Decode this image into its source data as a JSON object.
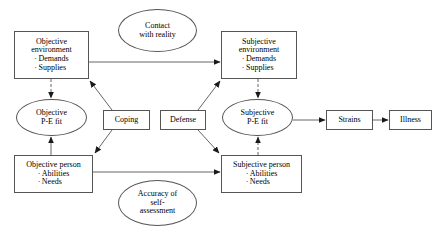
{
  "diagram": {
    "stroke_color": "#555555",
    "text_color": "#000000",
    "background_color": "#ffffff",
    "nodes": {
      "objective_environment": {
        "shape": "box",
        "title": "Objective",
        "title2": "environment",
        "bullets": [
          "Demands",
          "Supplies"
        ]
      },
      "contact_with_reality": {
        "shape": "ellipse",
        "line1": "Contact",
        "line2": "with reality"
      },
      "subjective_environment": {
        "shape": "box",
        "title": "Subjective",
        "title2": "environment",
        "bullets": [
          "Demands",
          "Supplies"
        ]
      },
      "objective_pe_fit": {
        "shape": "ellipse",
        "line1": "Objective",
        "line2": "P-E fit"
      },
      "coping": {
        "shape": "box",
        "label": "Coping"
      },
      "defense": {
        "shape": "box",
        "label": "Defense"
      },
      "subjective_pe_fit": {
        "shape": "ellipse",
        "line1": "Subjective",
        "line2": "P-E fit"
      },
      "strains": {
        "shape": "box",
        "label": "Strains"
      },
      "illness": {
        "shape": "box",
        "label": "Illness"
      },
      "objective_person": {
        "shape": "box",
        "title": "Objective person",
        "bullets": [
          "Abilities",
          "Needs"
        ]
      },
      "accuracy_of_self_assessment": {
        "shape": "ellipse",
        "line1": "Accuracy of",
        "line2": "self-",
        "line3": "assessment"
      },
      "subjective_person": {
        "shape": "box",
        "title": "Subjective person",
        "bullets": [
          "Abilities",
          "Needs"
        ]
      }
    },
    "edges": [
      {
        "from": "objective_environment",
        "to": "subjective_environment",
        "style": "solid"
      },
      {
        "from": "objective_person",
        "to": "subjective_person",
        "style": "solid"
      },
      {
        "from": "objective_environment",
        "to": "objective_pe_fit",
        "style": "dashed"
      },
      {
        "from": "objective_person",
        "to": "objective_pe_fit",
        "style": "solid"
      },
      {
        "from": "subjective_environment",
        "to": "subjective_pe_fit",
        "style": "dashed"
      },
      {
        "from": "subjective_person",
        "to": "subjective_pe_fit",
        "style": "dashed"
      },
      {
        "from": "coping",
        "to": "objective_environment",
        "style": "solid"
      },
      {
        "from": "coping",
        "to": "objective_person",
        "style": "solid"
      },
      {
        "from": "defense",
        "to": "subjective_environment",
        "style": "solid"
      },
      {
        "from": "defense",
        "to": "subjective_person",
        "style": "solid"
      },
      {
        "from": "subjective_pe_fit",
        "to": "strains",
        "style": "solid"
      },
      {
        "from": "strains",
        "to": "illness",
        "style": "solid"
      }
    ]
  }
}
